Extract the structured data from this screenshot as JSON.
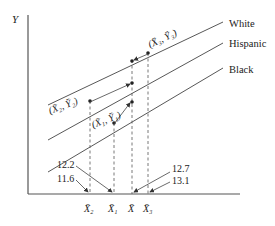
{
  "diagram": {
    "y_axis_label": "Y",
    "lines": [
      {
        "name": "White",
        "label": "White"
      },
      {
        "name": "Hispanic",
        "label": "Hispanic"
      },
      {
        "name": "Black",
        "label": "Black"
      }
    ],
    "points": [
      {
        "label": "(X̄₂, Ȳ₂)"
      },
      {
        "label": "(X̄₁, Ȳ₁)"
      },
      {
        "label": "(X̄₃, Ȳ₃)"
      }
    ],
    "x_ticks": [
      {
        "label": "X̄₂"
      },
      {
        "label": "X̄₁"
      },
      {
        "label": "X̄"
      },
      {
        "label": "X̄₃"
      }
    ],
    "values": {
      "x2": "11.6",
      "x1": "12.2",
      "xbar": "12.7",
      "x3": "13.1"
    }
  }
}
